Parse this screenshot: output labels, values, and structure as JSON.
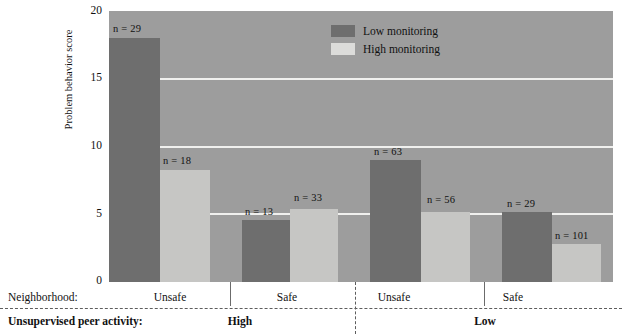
{
  "chart_data": {
    "type": "bar",
    "title": "",
    "xlabel": "",
    "ylabel": "Problem behavior score",
    "ylim": [
      0,
      20
    ],
    "yticks": [
      0,
      5,
      10,
      15,
      20
    ],
    "ytick_labels": [
      "0",
      "5",
      "10",
      "15",
      "20"
    ],
    "grid": true,
    "grid_axis": "y",
    "legend": {
      "position": "top-center",
      "entries": [
        {
          "label": "Low monitoring",
          "color": "#6e6e6e"
        },
        {
          "label": "High monitoring",
          "color": "#dcdcda"
        }
      ]
    },
    "categories": [
      "Unsafe",
      "Safe",
      "Unsafe",
      "Safe"
    ],
    "group_axis_labels": {
      "row1_title": "Neighborhood:",
      "row2_title": "Unsupervised peer activity:",
      "row2_values": [
        "High",
        "Low"
      ]
    },
    "series": [
      {
        "name": "Low monitoring",
        "color": "#6e6e6e",
        "values": [
          18.0,
          4.6,
          9.0,
          5.2
        ],
        "n": [
          29,
          13,
          63,
          29
        ]
      },
      {
        "name": "High monitoring",
        "color": "#c6c6c4",
        "values": [
          8.3,
          5.4,
          5.2,
          2.8
        ],
        "n": [
          18,
          33,
          56,
          101
        ]
      }
    ],
    "bars": [
      {
        "group": 0,
        "peer_activity": "High",
        "neighborhood": "Unsafe",
        "monitoring": "Low",
        "value": 18.0,
        "n": 29,
        "n_label": "n = 29"
      },
      {
        "group": 0,
        "peer_activity": "High",
        "neighborhood": "Unsafe",
        "monitoring": "High",
        "value": 8.3,
        "n": 18,
        "n_label": "n = 18"
      },
      {
        "group": 1,
        "peer_activity": "High",
        "neighborhood": "Safe",
        "monitoring": "Low",
        "value": 4.6,
        "n": 13,
        "n_label": "n = 13"
      },
      {
        "group": 1,
        "peer_activity": "High",
        "neighborhood": "Safe",
        "monitoring": "High",
        "value": 5.4,
        "n": 33,
        "n_label": "n = 33"
      },
      {
        "group": 2,
        "peer_activity": "Low",
        "neighborhood": "Unsafe",
        "monitoring": "Low",
        "value": 9.0,
        "n": 63,
        "n_label": "n = 63"
      },
      {
        "group": 2,
        "peer_activity": "Low",
        "neighborhood": "Unsafe",
        "monitoring": "High",
        "value": 5.2,
        "n": 56,
        "n_label": "n = 56"
      },
      {
        "group": 3,
        "peer_activity": "Low",
        "neighborhood": "Safe",
        "monitoring": "Low",
        "value": 5.2,
        "n": 29,
        "n_label": "n = 29"
      },
      {
        "group": 3,
        "peer_activity": "Low",
        "neighborhood": "Safe",
        "monitoring": "High",
        "value": 2.8,
        "n": 101,
        "n_label": "n = 101"
      }
    ],
    "colors": {
      "plot_background": "#9d9d9d",
      "gridline": "#f0f0ee",
      "low_monitoring": "#6e6e6e",
      "high_monitoring": "#c6c6c4",
      "text": "#111111"
    }
  },
  "axis": {
    "y_title": "Problem behavior score",
    "y_ticks": [
      "20",
      "15",
      "10",
      "5",
      "0"
    ]
  },
  "legend": {
    "low": "Low monitoring",
    "high": "High monitoring"
  },
  "bottom": {
    "neighborhood_title": "Neighborhood:",
    "peer_title": "Unsupervised peer activity:",
    "neighborhood_1": "Unsafe",
    "neighborhood_2": "Safe",
    "neighborhood_3": "Unsafe",
    "neighborhood_4": "Safe",
    "peer_high": "High",
    "peer_low": "Low"
  },
  "nlabels": {
    "b1": "n = 29",
    "b2": "n = 18",
    "b3": "n = 13",
    "b4": "n = 33",
    "b5": "n = 63",
    "b6": "n = 56",
    "b7": "n = 29",
    "b8": "n = 101"
  }
}
